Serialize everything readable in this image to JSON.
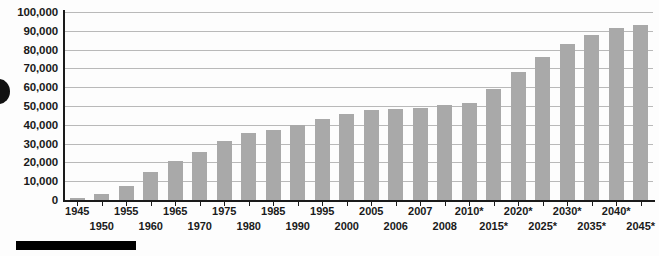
{
  "chart_data": {
    "type": "bar",
    "title": "",
    "subtitle": "",
    "xlabel": "",
    "ylabel": "",
    "ylim": [
      0,
      100000
    ],
    "ytick_labels": [
      "100,000",
      "90,000",
      "80,000",
      "70,000",
      "60,000",
      "50,000",
      "40,000",
      "30,000",
      "20,000",
      "10,000",
      "0"
    ],
    "ytick_values": [
      100000,
      90000,
      80000,
      70000,
      60000,
      50000,
      40000,
      30000,
      20000,
      10000,
      0
    ],
    "grid": true,
    "legend": null,
    "categories": [
      "1945",
      "1950",
      "1955",
      "1960",
      "1965",
      "1970",
      "1975",
      "1980",
      "1985",
      "1990",
      "1995",
      "2000",
      "2005",
      "2006",
      "2007",
      "2008",
      "2010*",
      "2015*",
      "2020*",
      "2025*",
      "2030*",
      "2035*",
      "2040*",
      "2045*"
    ],
    "values": [
      1000,
      3000,
      7500,
      15000,
      21000,
      25500,
      31500,
      35500,
      37000,
      40000,
      43000,
      46000,
      48000,
      48500,
      49000,
      50500,
      51500,
      59000,
      68000,
      76000,
      83000,
      88000,
      91500,
      93000
    ],
    "series": [
      {
        "name": "",
        "values": [
          1000,
          3000,
          7500,
          15000,
          21000,
          25500,
          31500,
          35500,
          37000,
          40000,
          43000,
          46000,
          48000,
          48500,
          49000,
          50500,
          51500,
          59000,
          68000,
          76000,
          83000,
          88000,
          91500,
          93000
        ]
      }
    ],
    "annotations": [
      "* projected values"
    ],
    "bar_color": "#a9a9a9",
    "axis_color": "#1a1a1a",
    "gridline_color": "#b9b9b9"
  }
}
